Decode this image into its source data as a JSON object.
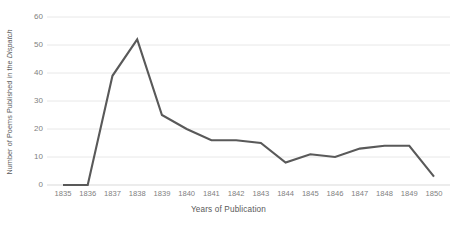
{
  "chart_data": {
    "type": "line",
    "title": "",
    "xlabel": "Years of Publication",
    "ylabel": "Number of Poems Published in the Dispatch",
    "ylabel_plain": "Number of Poems Published in the ",
    "ylabel_italic": "Dispatch",
    "categories": [
      1835,
      1836,
      1837,
      1838,
      1839,
      1840,
      1841,
      1842,
      1843,
      1844,
      1845,
      1846,
      1847,
      1848,
      1849,
      1850
    ],
    "x_tick_labels": [
      "1835",
      "1836",
      "1837",
      "1838",
      "1839",
      "1840",
      "1841",
      "1842",
      "1843",
      "1844",
      "1845",
      "1846",
      "1847",
      "1848",
      "1849",
      "1850"
    ],
    "values": [
      0,
      0,
      39,
      52,
      25,
      20,
      16,
      16,
      15,
      8,
      11,
      10,
      13,
      14,
      14,
      3
    ],
    "series": [
      {
        "name": "Number of Poems Published in the Dispatch",
        "values": [
          0,
          0,
          39,
          52,
          25,
          20,
          16,
          16,
          15,
          8,
          11,
          10,
          13,
          14,
          14,
          3
        ]
      }
    ],
    "ylim": [
      0,
      60
    ],
    "y_ticks": [
      0,
      10,
      20,
      30,
      40,
      50,
      60
    ],
    "y_tick_labels": [
      "0",
      "10",
      "20",
      "30",
      "40",
      "50",
      "60"
    ],
    "grid": "horizontal",
    "legend": "none",
    "line_color": "#595959",
    "gridline_color": "#e8e8e8",
    "axis_color": "#d9d9d9",
    "tick_label_color": "#7f7f7f",
    "axis_title_color": "#595959"
  }
}
